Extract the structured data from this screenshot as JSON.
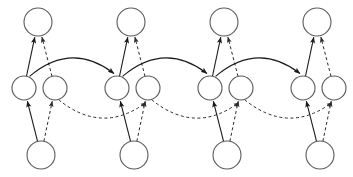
{
  "diagram": {
    "type": "node-link-diagram",
    "width": 353,
    "height": 177,
    "background_color": "#ffffff",
    "node_fill_color": "#ffffff",
    "node_stroke_color": "#5a5a5a",
    "solid_edge_color": "#1a1a1a",
    "dashed_edge_color": "#2a2a2a",
    "group_count": 4,
    "group_spacing": 93,
    "node_labels": [],
    "edge_labels": [],
    "nodes": [
      {
        "id": "t1",
        "role": "top",
        "group": 1,
        "cx": 38,
        "cy": 22,
        "r": 14
      },
      {
        "id": "ml1",
        "role": "middle-left",
        "group": 1,
        "cx": 24,
        "cy": 88,
        "r": 12
      },
      {
        "id": "mr1",
        "role": "middle-right",
        "group": 1,
        "cx": 55,
        "cy": 88,
        "r": 12
      },
      {
        "id": "b1",
        "role": "bottom",
        "group": 1,
        "cx": 41,
        "cy": 155,
        "r": 14
      },
      {
        "id": "t2",
        "role": "top",
        "group": 2,
        "cx": 131,
        "cy": 22,
        "r": 14
      },
      {
        "id": "ml2",
        "role": "middle-left",
        "group": 2,
        "cx": 117,
        "cy": 88,
        "r": 12
      },
      {
        "id": "mr2",
        "role": "middle-right",
        "group": 2,
        "cx": 148,
        "cy": 88,
        "r": 12
      },
      {
        "id": "b2",
        "role": "bottom",
        "group": 2,
        "cx": 134,
        "cy": 155,
        "r": 14
      },
      {
        "id": "t3",
        "role": "top",
        "group": 3,
        "cx": 224,
        "cy": 22,
        "r": 14
      },
      {
        "id": "ml3",
        "role": "middle-left",
        "group": 3,
        "cx": 210,
        "cy": 88,
        "r": 12
      },
      {
        "id": "mr3",
        "role": "middle-right",
        "group": 3,
        "cx": 241,
        "cy": 88,
        "r": 12
      },
      {
        "id": "b3",
        "role": "bottom",
        "group": 3,
        "cx": 227,
        "cy": 155,
        "r": 14
      },
      {
        "id": "t4",
        "role": "top",
        "group": 4,
        "cx": 317,
        "cy": 22,
        "r": 14
      },
      {
        "id": "ml4",
        "role": "middle-left",
        "group": 4,
        "cx": 303,
        "cy": 88,
        "r": 12
      },
      {
        "id": "mr4",
        "role": "middle-right",
        "group": 4,
        "cx": 334,
        "cy": 88,
        "r": 12
      },
      {
        "id": "b4",
        "role": "bottom",
        "group": 4,
        "cx": 320,
        "cy": 155,
        "r": 14
      }
    ],
    "edges": [
      {
        "from": "ml1",
        "to": "t1",
        "style": "solid",
        "shape": "line",
        "arrow": true
      },
      {
        "from": "mr1",
        "to": "t1",
        "style": "dashed",
        "shape": "line",
        "arrow": true
      },
      {
        "from": "b1",
        "to": "ml1",
        "style": "solid",
        "shape": "line",
        "arrow": true
      },
      {
        "from": "b1",
        "to": "mr1",
        "style": "dashed",
        "shape": "line",
        "arrow": true
      },
      {
        "from": "ml2",
        "to": "t2",
        "style": "solid",
        "shape": "line",
        "arrow": true
      },
      {
        "from": "mr2",
        "to": "t2",
        "style": "dashed",
        "shape": "line",
        "arrow": true
      },
      {
        "from": "b2",
        "to": "ml2",
        "style": "solid",
        "shape": "line",
        "arrow": true
      },
      {
        "from": "b2",
        "to": "mr2",
        "style": "dashed",
        "shape": "line",
        "arrow": true
      },
      {
        "from": "ml3",
        "to": "t3",
        "style": "solid",
        "shape": "line",
        "arrow": true
      },
      {
        "from": "mr3",
        "to": "t3",
        "style": "dashed",
        "shape": "line",
        "arrow": true
      },
      {
        "from": "b3",
        "to": "ml3",
        "style": "solid",
        "shape": "line",
        "arrow": true
      },
      {
        "from": "b3",
        "to": "mr3",
        "style": "dashed",
        "shape": "line",
        "arrow": true
      },
      {
        "from": "ml4",
        "to": "t4",
        "style": "solid",
        "shape": "line",
        "arrow": true
      },
      {
        "from": "mr4",
        "to": "t4",
        "style": "dashed",
        "shape": "line",
        "arrow": true
      },
      {
        "from": "b4",
        "to": "ml4",
        "style": "solid",
        "shape": "line",
        "arrow": true
      },
      {
        "from": "b4",
        "to": "mr4",
        "style": "dashed",
        "shape": "line",
        "arrow": true
      },
      {
        "from": "ml1",
        "to": "ml2",
        "style": "solid",
        "shape": "arc-up",
        "arrow": true
      },
      {
        "from": "ml2",
        "to": "ml3",
        "style": "solid",
        "shape": "arc-up",
        "arrow": true
      },
      {
        "from": "ml3",
        "to": "ml4",
        "style": "solid",
        "shape": "arc-up",
        "arrow": true
      },
      {
        "from": "mr1",
        "to": "mr2",
        "style": "dashed",
        "shape": "arc-down",
        "arrow": true
      },
      {
        "from": "mr2",
        "to": "mr3",
        "style": "dashed",
        "shape": "arc-down",
        "arrow": true
      },
      {
        "from": "mr3",
        "to": "mr4",
        "style": "dashed",
        "shape": "arc-down",
        "arrow": true
      }
    ]
  }
}
